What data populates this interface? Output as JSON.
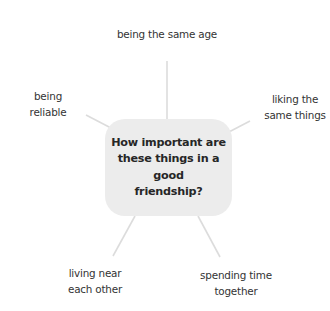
{
  "diagram": {
    "type": "mind-map",
    "center": {
      "lines": [
        "How important are",
        "these things in a good",
        "friendship?"
      ]
    },
    "branches": [
      {
        "position": "top",
        "lines": [
          "being the same age"
        ]
      },
      {
        "position": "left",
        "lines": [
          "being",
          "reliable"
        ]
      },
      {
        "position": "right",
        "lines": [
          "liking the",
          "same things"
        ]
      },
      {
        "position": "bottom-left",
        "lines": [
          "living near",
          "each other"
        ]
      },
      {
        "position": "bottom-right",
        "lines": [
          "spending time",
          "together"
        ]
      }
    ],
    "colors": {
      "center_fill": "#ececec",
      "connector": "#dcdcdc",
      "text": "#333333",
      "background": "#ffffff"
    }
  }
}
